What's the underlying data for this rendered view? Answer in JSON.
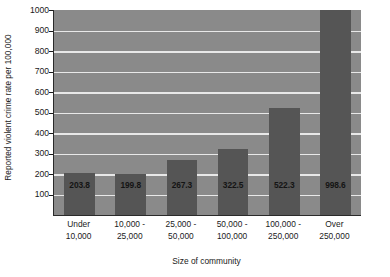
{
  "chart_data": {
    "type": "bar",
    "title": "",
    "subtitle": "",
    "xlabel": "Size of community",
    "ylabel": "Reported violent crime rate per 100,000",
    "categories": [
      "Under\n10,000",
      "10,000 -\n25,000",
      "25,000 -\n50,000",
      "50,000 -\n100,000",
      "100,000 -\n250,000",
      "Over\n250,000"
    ],
    "category_lines": [
      [
        "Under",
        "10,000"
      ],
      [
        "10,000 -",
        "25,000"
      ],
      [
        "25,000 -",
        "50,000"
      ],
      [
        "50,000 -",
        "100,000"
      ],
      [
        "100,000 -",
        "250,000"
      ],
      [
        "Over",
        "250,000"
      ]
    ],
    "values": [
      203.8,
      199.8,
      267.3,
      322.5,
      522.3,
      998.6
    ],
    "value_labels": [
      "203.8",
      "199.8",
      "267.3",
      "322.5",
      "522.3",
      "998.6"
    ],
    "ylim": [
      0,
      1000
    ],
    "yticks": [
      100,
      200,
      300,
      400,
      500,
      600,
      700,
      800,
      900,
      1000
    ],
    "ytick_labels": [
      "100",
      "200",
      "300",
      "400",
      "500",
      "600",
      "700",
      "800",
      "900",
      "1000"
    ],
    "grid": true,
    "grid_axis": "y",
    "legend": false,
    "legend_position": "none",
    "colors": {
      "bar": "#555555",
      "plot_background": "#8a8a8a",
      "gridline": "#e8e8e8",
      "axis": "#2a2a2a",
      "text": "#1a1a1a",
      "figure_background": "#ffffff",
      "value_label": "#141414"
    }
  }
}
